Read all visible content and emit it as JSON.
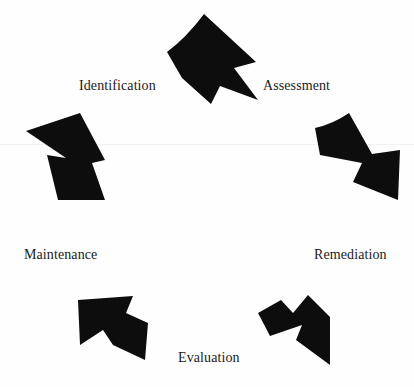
{
  "diagram": {
    "type": "cyclical-process",
    "title": "",
    "background_color": "#fefefe",
    "arrow_color": "#0d0d0d",
    "text_color": "#1b1b1b",
    "stage_count": 5,
    "stages": [
      {
        "id": "identification",
        "label": "Identification",
        "order": 1,
        "angle_deg": 270,
        "x": 79,
        "y": 79
      },
      {
        "id": "assessment",
        "label": "Assessment",
        "order": 2,
        "angle_deg": 342,
        "x": 263,
        "y": 79
      },
      {
        "id": "remediation",
        "label": "Remediation",
        "order": 3,
        "angle_deg": 54,
        "x": 314,
        "y": 248
      },
      {
        "id": "evaluation",
        "label": "Evaluation",
        "order": 4,
        "angle_deg": 126,
        "x": 178,
        "y": 351
      },
      {
        "id": "maintenance",
        "label": "Maintenance",
        "order": 5,
        "angle_deg": 198,
        "x": 24,
        "y": 248
      }
    ],
    "arrows": [
      {
        "id": "arrow-top",
        "points_toward": "assessment",
        "direction": "right-down",
        "rotation_deg": 18
      },
      {
        "id": "arrow-right",
        "points_toward": "remediation",
        "direction": "down-right",
        "rotation_deg": 90
      },
      {
        "id": "arrow-bottom-right",
        "points_toward": "evaluation",
        "direction": "down-left",
        "rotation_deg": 162
      },
      {
        "id": "arrow-bottom-left",
        "points_toward": "maintenance",
        "direction": "up-left",
        "rotation_deg": 234
      },
      {
        "id": "arrow-left",
        "points_toward": "identification",
        "direction": "up-right",
        "rotation_deg": 306
      }
    ]
  }
}
